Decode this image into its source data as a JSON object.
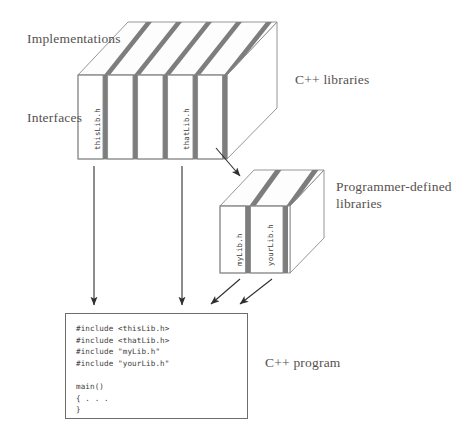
{
  "figure": {
    "type": "diagram"
  },
  "labels": {
    "implementations": "Implementations",
    "interfaces": "Interfaces",
    "cpp_libraries": "C++ libraries",
    "programmer_defined_libraries": "Programmer-defined libraries",
    "cpp_program": "C++ program"
  },
  "cpp_library_box": {
    "slab_count": 5,
    "visible_slab_labels": [
      {
        "index": 0,
        "text": "thisLib.h"
      },
      {
        "index": 3,
        "text": "thatLib.h"
      }
    ]
  },
  "programmer_library_box": {
    "slab_count": 2,
    "visible_slab_labels": [
      {
        "index": 0,
        "text": "myLib.h"
      },
      {
        "index": 1,
        "text": "yourLib.h"
      }
    ]
  },
  "code_box": {
    "lines": [
      "#include <thisLib.h>",
      "#include <thatLib.h>",
      "#include \"myLib.h\"",
      "#include \"yourLib.h\"",
      "",
      "main()",
      "{ . . .",
      "}"
    ],
    "text": "#include <thisLib.h>\n#include <thatLib.h>\n#include \"myLib.h\"\n#include \"yourLib.h\"\n\nmain()\n{ . . .\n}"
  },
  "arrows": [
    {
      "name": "thisLib-to-program",
      "from": "cpp-library-box",
      "to": "code-box"
    },
    {
      "name": "thatLib-to-program",
      "from": "cpp-library-box",
      "to": "code-box"
    },
    {
      "name": "libraries-to-programmer-libraries",
      "from": "cpp-library-box",
      "to": "programmer-library-box"
    },
    {
      "name": "myLib-to-program",
      "from": "programmer-library-box",
      "to": "code-box"
    },
    {
      "name": "yourLib-to-program",
      "from": "programmer-library-box",
      "to": "code-box"
    }
  ],
  "colors": {
    "background": "#ffffff",
    "slab_fill": "#ffffff",
    "slab_separator": "#7d7d7d",
    "outline": "#8a8a8a",
    "text": "#55514f",
    "code_text": "#3d3d3d",
    "arrow": "#2e2e2e"
  }
}
